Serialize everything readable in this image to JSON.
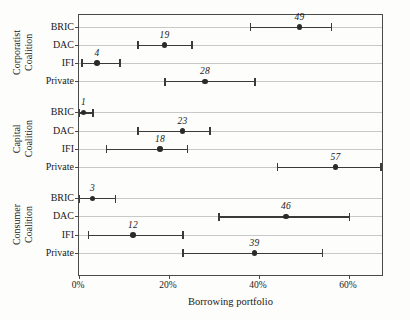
{
  "chart_data": {
    "type": "scatter",
    "subtype": "dot-and-whisker point estimates with confidence intervals",
    "title": "",
    "xlabel": "Borrowing portfolio",
    "ylabel": "",
    "xlim": [
      0,
      67.8
    ],
    "xunit": "%",
    "xticks": [
      0,
      20,
      40,
      60
    ],
    "xticklabels": [
      "0%",
      "20%",
      "40%",
      "60%"
    ],
    "grid": "horizontal row lines only",
    "legend": "none",
    "categories": [
      "BRIC",
      "DAC",
      "IFI",
      "Private"
    ],
    "groups": [
      {
        "name": "Corporatist Coalition",
        "label_lines": [
          "Corporatist",
          "Coalition"
        ],
        "points": [
          {
            "category": "BRIC",
            "value": 49,
            "label": "49",
            "ci_low": 38,
            "ci_high": 56
          },
          {
            "category": "DAC",
            "value": 19,
            "label": "19",
            "ci_low": 13,
            "ci_high": 25
          },
          {
            "category": "IFI",
            "value": 4,
            "label": "4",
            "ci_low": 0.5,
            "ci_high": 9
          },
          {
            "category": "Private",
            "value": 28,
            "label": "28",
            "ci_low": 19,
            "ci_high": 39
          }
        ]
      },
      {
        "name": "Capital Coalition",
        "label_lines": [
          "Capital",
          "Coalition"
        ],
        "points": [
          {
            "category": "BRIC",
            "value": 1,
            "label": "1",
            "ci_low": 0,
            "ci_high": 3
          },
          {
            "category": "DAC",
            "value": 23,
            "label": "23",
            "ci_low": 13,
            "ci_high": 29
          },
          {
            "category": "IFI",
            "value": 18,
            "label": "18",
            "ci_low": 6,
            "ci_high": 24
          },
          {
            "category": "Private",
            "value": 57,
            "label": "57",
            "ci_low": 44,
            "ci_high": 67
          }
        ]
      },
      {
        "name": "Consumer Coalition",
        "label_lines": [
          "Consumer",
          "Coalition"
        ],
        "points": [
          {
            "category": "BRIC",
            "value": 3,
            "label": "3",
            "ci_low": 0,
            "ci_high": 8
          },
          {
            "category": "DAC",
            "value": 46,
            "label": "46",
            "ci_low": 31,
            "ci_high": 60
          },
          {
            "category": "IFI",
            "value": 12,
            "label": "12",
            "ci_low": 2,
            "ci_high": 23
          },
          {
            "category": "Private",
            "value": 39,
            "label": "39",
            "ci_low": 23,
            "ci_high": 54
          }
        ]
      }
    ],
    "colors": {
      "point": "#2b2b2b",
      "interval": "#3a3a3a",
      "rowline": "#c9c9c9",
      "frame": "#4a4a4a",
      "background": "#fdfdfc",
      "text": "#1a1a1a"
    }
  }
}
